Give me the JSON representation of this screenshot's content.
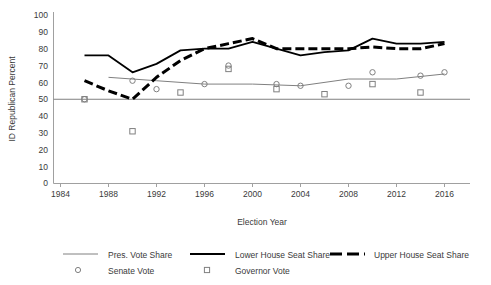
{
  "chart_data": {
    "type": "line",
    "title": "",
    "xlabel": "Election Year",
    "ylabel": "ID Republican Percent",
    "xlim": [
      1984,
      2018
    ],
    "ylim": [
      0,
      100
    ],
    "xticks": [
      1984,
      1988,
      1992,
      1996,
      2000,
      2004,
      2008,
      2012,
      2016
    ],
    "yticks": [
      0,
      10,
      20,
      30,
      40,
      50,
      60,
      70,
      80,
      90,
      100
    ],
    "grid": false,
    "legend_position": "bottom",
    "reference_line": {
      "y": 50,
      "label": "",
      "color": "#808080"
    },
    "series": [
      {
        "name": "Pres. Vote Share",
        "style": "thin-line",
        "color": "#808080",
        "x": [
          1988,
          1992,
          1996,
          2000,
          2004,
          2008,
          2012,
          2016
        ],
        "values": [
          63,
          61,
          59,
          59,
          58,
          62,
          62,
          65
        ],
        "marker": "none"
      },
      {
        "name": "Lower House Seat Share",
        "style": "thick-line",
        "color": "#000000",
        "x": [
          1986,
          1988,
          1990,
          1992,
          1994,
          1996,
          1998,
          2000,
          2002,
          2004,
          2006,
          2008,
          2010,
          2012,
          2014,
          2016
        ],
        "values": [
          76,
          76,
          66,
          71,
          79,
          80,
          80,
          84,
          80,
          76,
          78,
          79,
          86,
          83,
          83,
          84
        ],
        "marker": "none"
      },
      {
        "name": "Upper House Seat Share",
        "style": "thick-dashed",
        "color": "#000000",
        "x": [
          1986,
          1988,
          1990,
          1992,
          1994,
          1996,
          1998,
          2000,
          2002,
          2004,
          2006,
          2008,
          2010,
          2012,
          2014,
          2016
        ],
        "values": [
          61,
          55,
          50,
          63,
          73,
          80,
          83,
          86,
          80,
          80,
          80,
          80,
          81,
          80,
          80,
          83
        ],
        "marker": "none"
      },
      {
        "name": "Senate Vote",
        "style": "marker-only",
        "color": "#808080",
        "x": [
          1986,
          1990,
          1992,
          1996,
          1998,
          2002,
          2004,
          2008,
          2010,
          2014,
          2016
        ],
        "values": [
          50,
          61,
          56,
          59,
          70,
          59,
          58,
          58,
          66,
          64,
          66
        ],
        "marker": "circle"
      },
      {
        "name": "Governor Vote",
        "style": "marker-only",
        "color": "#808080",
        "x": [
          1986,
          1990,
          1994,
          1998,
          2002,
          2006,
          2010,
          2014
        ],
        "values": [
          50,
          31,
          54,
          68,
          56,
          53,
          59,
          54
        ],
        "marker": "square"
      }
    ]
  },
  "axis": {
    "ylabel": "ID Republican Percent",
    "xlabel": "Election Year"
  },
  "ytick_labels": [
    "100",
    "90",
    "80",
    "70",
    "60",
    "50",
    "40",
    "30",
    "20",
    "10",
    "0"
  ],
  "xtick_labels": [
    "1984",
    "1988",
    "1992",
    "1996",
    "2000",
    "2004",
    "2008",
    "2012",
    "2016"
  ],
  "legend": {
    "row1": [
      {
        "label": "Pres. Vote Share",
        "swatch": "thin-line-swatch"
      },
      {
        "label": "Lower House Seat Share",
        "swatch": "thick-line-swatch"
      },
      {
        "label": "Upper House Seat Share",
        "swatch": "thick-dashed-swatch"
      }
    ],
    "row2": [
      {
        "label": "Senate Vote",
        "swatch": "circle-marker-swatch"
      },
      {
        "label": "Governor Vote",
        "swatch": "square-marker-swatch"
      }
    ]
  },
  "colors": {
    "thin_line": "#808080",
    "thick_line": "#000000",
    "dashed_line": "#000000",
    "axis": "#a0a0a0",
    "text": "#3a3a3a",
    "marker_stroke": "#808080"
  }
}
